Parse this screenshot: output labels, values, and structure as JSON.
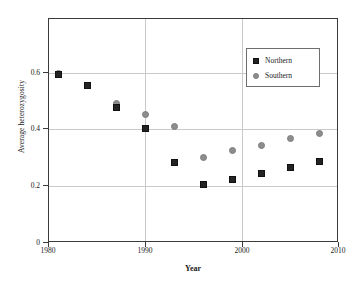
{
  "chart_data": {
    "type": "scatter",
    "title": "",
    "xlabel": "Year",
    "ylabel": "Average heterozygosity",
    "xlim": [
      1980,
      2010
    ],
    "ylim": [
      0,
      0.6
    ],
    "xticks": [
      "1980",
      "1990",
      "2000",
      "2010"
    ],
    "yticks": [
      "0",
      "0.2",
      "0.4",
      "0.6"
    ],
    "grid": true,
    "legend_position": "upper-right",
    "x": [
      1981,
      1984,
      1987,
      1990,
      1993,
      1996,
      1999,
      2002,
      2005,
      2008
    ],
    "series": [
      {
        "name": "Northern",
        "marker": "square",
        "color": "#232323",
        "values": [
          0.595,
          0.555,
          0.478,
          0.403,
          0.283,
          0.205,
          0.223,
          0.245,
          0.268,
          0.288
        ]
      },
      {
        "name": "Southern",
        "marker": "circle",
        "color": "#8d8d8d",
        "values": [
          0.6,
          0.556,
          0.492,
          0.452,
          0.41,
          0.303,
          0.325,
          0.345,
          0.368,
          0.385
        ]
      }
    ]
  },
  "axes": {
    "x_title": "Year",
    "y_title": "Average heterozygosity",
    "x_tick_labels": [
      "1980",
      "1990",
      "2000",
      "2010"
    ],
    "y_tick_labels": [
      "0",
      "0.2",
      "0.4",
      "0.6"
    ]
  },
  "legend": {
    "entries": [
      {
        "label": "Northern",
        "icon": "square-marker-icon"
      },
      {
        "label": "Southern",
        "icon": "circle-marker-icon"
      }
    ]
  }
}
